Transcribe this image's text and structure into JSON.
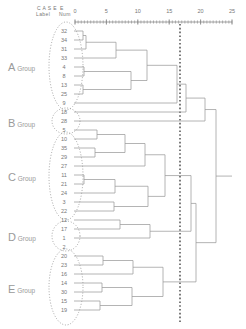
{
  "header": {
    "case_label_line1": "C A S E",
    "case_label_line2": "Label",
    "num_line1": "",
    "num_line2": "Num"
  },
  "axis": {
    "ticks": [
      0,
      5,
      10,
      15,
      20,
      25
    ],
    "tick_labels": [
      "0",
      "5",
      "10",
      "15",
      "20",
      "25"
    ],
    "x_min": 0,
    "x_max": 25,
    "px_min": 75,
    "px_max": 232,
    "y_px": 22,
    "color": "#8a8a8a"
  },
  "cut_line": {
    "value": 20,
    "x_px": 180,
    "color": "#5a5a5a",
    "style": "dotted"
  },
  "groups": [
    {
      "id": "A",
      "big": "A",
      "small": "Group",
      "label_x": 8,
      "label_y": 66,
      "cx": 66,
      "cy": 66,
      "rx": 17,
      "ry": 44
    },
    {
      "id": "B",
      "big": "B",
      "small": "Group",
      "label_x": 8,
      "label_y": 122,
      "cx": 66,
      "cy": 121,
      "rx": 14,
      "ry": 13
    },
    {
      "id": "C",
      "big": "C",
      "small": "Group",
      "label_x": 8,
      "label_y": 176,
      "cx": 66,
      "cy": 176,
      "rx": 17,
      "ry": 44
    },
    {
      "id": "D",
      "big": "D",
      "small": "Group",
      "label_x": 8,
      "label_y": 236,
      "cx": 66,
      "cy": 236,
      "rx": 14,
      "ry": 15
    },
    {
      "id": "E",
      "big": "E",
      "small": "Group",
      "label_x": 8,
      "label_y": 288,
      "cx": 66,
      "cy": 287,
      "rx": 17,
      "ry": 38
    }
  ],
  "chart_data": {
    "type": "dendrogram",
    "title": "",
    "xlabel": "Rescaled Distance Cluster Combine",
    "ylabel": "",
    "xlim": [
      0,
      25
    ],
    "xticks": [
      0,
      5,
      10,
      15,
      20,
      25
    ],
    "grid": false,
    "legend": "none",
    "leaf_order": [
      32,
      34,
      31,
      33,
      4,
      8,
      13,
      25,
      9,
      18,
      28,
      5,
      10,
      35,
      29,
      27,
      11,
      21,
      24,
      3,
      22,
      12,
      17,
      1,
      2,
      20,
      23,
      16,
      14,
      30,
      15,
      19
    ],
    "leaf_count": 32,
    "leaf_labels": [
      "32",
      "34",
      "31",
      "33",
      "4",
      "8",
      "13",
      "25",
      "9",
      "18",
      "28",
      "5",
      "10",
      "35",
      "29",
      "27",
      "11",
      "21",
      "24",
      "3",
      "22",
      "12",
      "17",
      "1",
      "2",
      "20",
      "23",
      "16",
      "14",
      "30",
      "15",
      "19"
    ],
    "leaf_y_px": [
      31,
      40,
      49,
      58,
      67,
      76,
      85,
      94,
      103,
      112,
      121,
      130,
      139,
      148,
      157,
      166,
      175,
      184,
      193,
      202,
      211,
      220,
      229,
      238,
      247,
      256,
      265,
      274,
      283,
      292,
      301,
      310
    ],
    "group_assignment": [
      "A",
      "A",
      "A",
      "A",
      "A",
      "A",
      "A",
      "A",
      "A",
      "A",
      "B",
      "C",
      "C",
      "C",
      "C",
      "C",
      "C",
      "C",
      "C",
      "C",
      "C",
      "D",
      "D",
      "D",
      "E",
      "E",
      "E",
      "E",
      "E",
      "E",
      "E",
      "E"
    ],
    "merges": [
      {
        "left": "32",
        "right": "34",
        "height": 1.2,
        "x_px": 83,
        "y1": 31,
        "y2": 40
      },
      {
        "left": "m0",
        "right": "31",
        "height": 1.6,
        "x_px": 86,
        "y1": 35.5,
        "y2": 49
      },
      {
        "left": "4",
        "right": "8",
        "height": 1.3,
        "x_px": 84,
        "y1": 67,
        "y2": 76
      },
      {
        "left": "13",
        "right": "25",
        "height": 1.2,
        "x_px": 83,
        "y1": 85,
        "y2": 94
      },
      {
        "left": "11",
        "right": "21",
        "height": 1.4,
        "x_px": 84,
        "y1": 175,
        "y2": 184
      },
      {
        "left": "5",
        "right": "10",
        "height": 3.5,
        "x_px": 97,
        "y1": 130,
        "y2": 139
      },
      {
        "left": "35",
        "right": "29",
        "height": 3.2,
        "x_px": 95,
        "y1": 148,
        "y2": 157
      },
      {
        "left": "20",
        "right": "23",
        "height": 4.5,
        "x_px": 103,
        "y1": 256,
        "y2": 265
      },
      {
        "left": "14",
        "right": "30",
        "height": 4.3,
        "x_px": 102,
        "y1": 283,
        "y2": 292
      },
      {
        "left": "15",
        "right": "19",
        "height": 4.0,
        "x_px": 100,
        "y1": 301,
        "y2": 310
      },
      {
        "left": "m1",
        "right": "33",
        "height": 6.5,
        "x_px": 116,
        "y1": 42,
        "y2": 58
      },
      {
        "left": "m4",
        "right": "24",
        "height": 6.4,
        "x_px": 115,
        "y1": 179.5,
        "y2": 193
      },
      {
        "left": "3",
        "right": "22",
        "height": 6.2,
        "x_px": 114,
        "y1": 202,
        "y2": 211
      },
      {
        "left": "12",
        "right": "17",
        "height": 7.2,
        "x_px": 120,
        "y1": 220,
        "y2": 229
      },
      {
        "left": "m5",
        "right": "m6",
        "height": 8.0,
        "x_px": 125,
        "y1": 134.5,
        "y2": 152.5
      },
      {
        "left": "m2",
        "right": "m3",
        "height": 9.0,
        "x_px": 131,
        "y1": 71.5,
        "y2": 89.5
      },
      {
        "left": "m7",
        "right": "16",
        "height": 9.3,
        "x_px": 133,
        "y1": 260.5,
        "y2": 274
      },
      {
        "left": "m8",
        "right": "m9",
        "height": 9.1,
        "x_px": 132,
        "y1": 287.5,
        "y2": 305.5
      },
      {
        "left": "m10",
        "right": "m15",
        "height": 11.5,
        "x_px": 147,
        "y1": 50,
        "y2": 80.5
      },
      {
        "left": "m14",
        "right": "27",
        "height": 11.2,
        "x_px": 145,
        "y1": 143.5,
        "y2": 166
      },
      {
        "left": "m11",
        "right": "m12",
        "height": 11.8,
        "x_px": 148,
        "y1": 186,
        "y2": 206.5
      },
      {
        "left": "m13",
        "right": "1",
        "height": 12.0,
        "x_px": 150,
        "y1": 224.5,
        "y2": 238
      },
      {
        "left": "m19",
        "right": "m20",
        "height": 14.5,
        "x_px": 165,
        "y1": 154.5,
        "y2": 196
      },
      {
        "left": "m16",
        "right": "m17",
        "height": 14.2,
        "x_px": 163,
        "y1": 267,
        "y2": 296.5
      },
      {
        "left": "m18",
        "right": "9",
        "height": 16.5,
        "x_px": 177,
        "y1": 65,
        "y2": 103
      },
      {
        "left": "m24",
        "right": "18",
        "height": 18.0,
        "x_px": 186,
        "y1": 84,
        "y2": 112
      },
      {
        "left": "m22",
        "right": "m21",
        "height": 19.0,
        "x_px": 191,
        "y1": 175,
        "y2": 231
      },
      {
        "left": "m26",
        "right": "m23",
        "height": 20.5,
        "x_px": 196,
        "y1": 203,
        "y2": 281.5
      },
      {
        "left": "m25",
        "right": "28",
        "height": 22.0,
        "x_px": 205,
        "y1": 98,
        "y2": 121
      },
      {
        "left": "m28",
        "right": "m27",
        "height": 24.0,
        "x_px": 216,
        "y1": 109.5,
        "y2": 242
      }
    ]
  }
}
